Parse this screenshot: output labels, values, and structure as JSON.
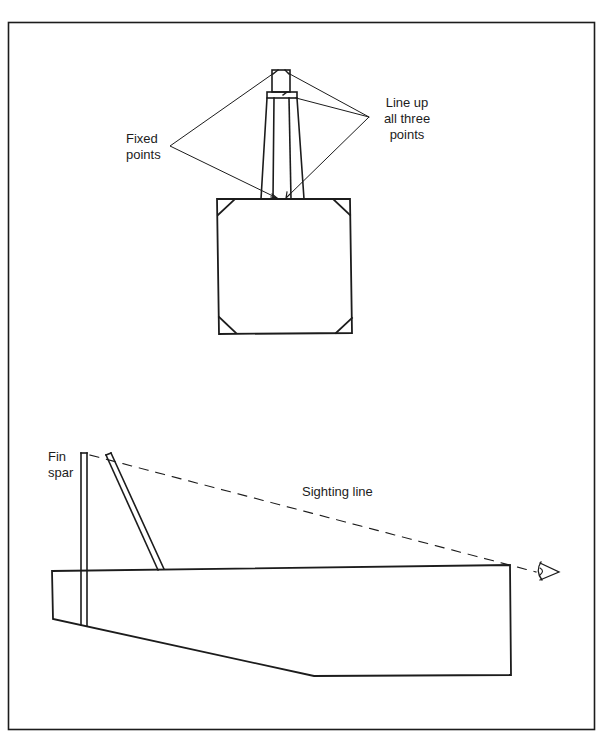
{
  "figure": {
    "upper_view": {
      "description": "Front view of fin and fuselage section",
      "labels": {
        "fixed_points_line1": "Fixed",
        "fixed_points_line2": "points",
        "line_up_line1": "Line up",
        "line_up_line2": "all three",
        "line_up_line3": "points"
      }
    },
    "lower_view": {
      "description": "Side view of fuselage with fin spar and sighting line",
      "labels": {
        "fin_spar_line1": "Fin",
        "fin_spar_line2": "spar",
        "sighting_line": "Sighting line"
      },
      "icons": {
        "eye": "eye-icon"
      }
    },
    "colors": {
      "ink": "#1c1c1c",
      "background": "#ffffff"
    }
  }
}
